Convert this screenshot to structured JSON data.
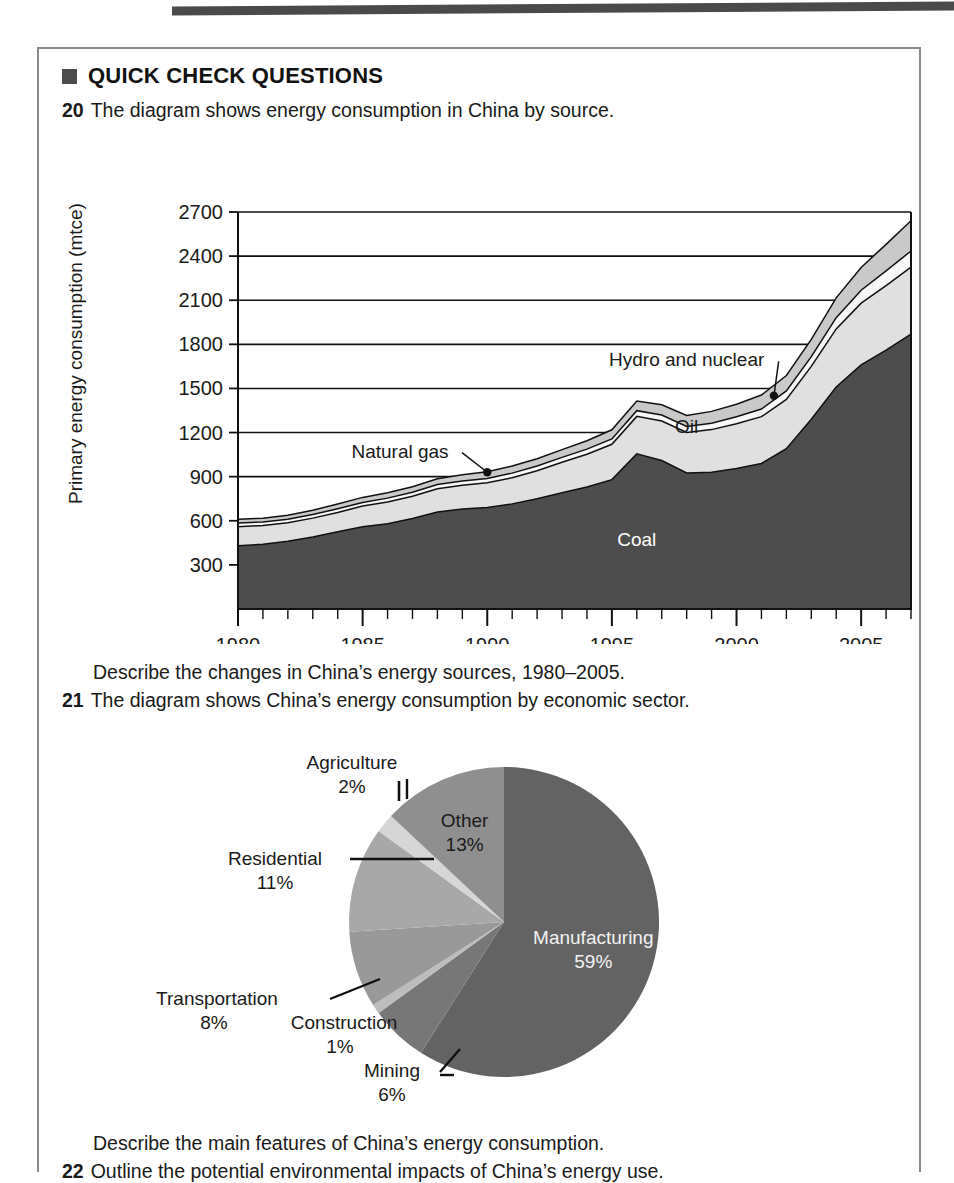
{
  "page": {
    "top_rule": "decorative-rule"
  },
  "heading": {
    "bullet": "filled-square-icon",
    "text": "QUICK CHECK QUESTIONS"
  },
  "questions": [
    {
      "number": "20",
      "text": "The diagram shows energy consumption in China by source."
    },
    {
      "number": "",
      "text": "Describe the changes in China’s energy sources, 1980–2005."
    },
    {
      "number": "21",
      "text": "The diagram shows China’s energy consumption by economic sector."
    },
    {
      "number": "",
      "text": "Describe the main features of China’s energy consumption."
    },
    {
      "number": "22",
      "text": "Outline the potential environmental impacts of China’s energy use."
    }
  ],
  "colors": {
    "coal": "#4d4d4d",
    "oil": "#e0e0e0",
    "natural_gas": "#f7f7f7",
    "hydro_nuclear": "#c9c9c9",
    "pie_manufacturing": "#636363",
    "pie_other": "#8f8f8f",
    "pie_agriculture": "#d6d6d6",
    "pie_residential": "#a8a8a8",
    "pie_transportation": "#999999",
    "pie_construction": "#bdbdbd",
    "pie_mining": "#777777",
    "outline": "#111111",
    "gridline": "#111111",
    "box_border": "#8a8a8a",
    "rule": "#4a4a4a"
  },
  "chart_data": [
    {
      "type": "area",
      "id": "energy-by-source",
      "title": "",
      "xlabel": "",
      "ylabel": "Primary energy consumption (mtce)",
      "ylim": [
        0,
        2700
      ],
      "xlim": [
        1980,
        2007
      ],
      "grid": true,
      "legend_position": "inline-labels",
      "ytick_labels": [
        "300",
        "600",
        "900",
        "1200",
        "1500",
        "1800",
        "2100",
        "2400",
        "2700"
      ],
      "yticks": [
        300,
        600,
        900,
        1200,
        1500,
        1800,
        2100,
        2400,
        2700
      ],
      "xtick_labels": [
        "1980",
        "1985",
        "1990",
        "1995",
        "2000",
        "2005"
      ],
      "xticks": [
        1980,
        1985,
        1990,
        1995,
        2000,
        2005
      ],
      "minor_xtick_interval": 1,
      "x": [
        1980,
        1981,
        1982,
        1983,
        1984,
        1985,
        1986,
        1987,
        1988,
        1989,
        1990,
        1991,
        1992,
        1993,
        1994,
        1995,
        1996,
        1997,
        1998,
        1999,
        2000,
        2001,
        2002,
        2003,
        2004,
        2005,
        2006,
        2007
      ],
      "series": [
        {
          "name": "Coal",
          "label_x": 1996,
          "label_y": 430,
          "label_color": "#ffffff",
          "values": [
            430,
            440,
            460,
            490,
            525,
            560,
            580,
            615,
            660,
            680,
            690,
            715,
            750,
            790,
            830,
            880,
            1055,
            1010,
            925,
            930,
            955,
            990,
            1090,
            1290,
            1510,
            1660,
            1760,
            1870
          ]
        },
        {
          "name": "Oil",
          "label_x": 1998,
          "label_y": 1200,
          "label_color": "#1a1a1a",
          "values": [
            130,
            128,
            126,
            128,
            132,
            140,
            148,
            152,
            158,
            162,
            168,
            178,
            190,
            208,
            222,
            240,
            255,
            268,
            275,
            290,
            305,
            318,
            335,
            360,
            395,
            420,
            440,
            455
          ]
        },
        {
          "name": "Natural gas",
          "label_x": 1986.5,
          "label_y": 1030,
          "label_color": "#1a1a1a",
          "leader_to_x": 1990,
          "leader_to_y": 930,
          "values": [
            25,
            24,
            24,
            24,
            25,
            25,
            26,
            27,
            28,
            29,
            30,
            31,
            32,
            33,
            35,
            37,
            39,
            41,
            42,
            44,
            47,
            52,
            58,
            66,
            76,
            88,
            100,
            110
          ]
        },
        {
          "name": "Hydro and nuclear",
          "label_x": 1998,
          "label_y": 1650,
          "label_color": "#1a1a1a",
          "leader_to_x": 2001.5,
          "leader_to_y": 1450,
          "values": [
            25,
            26,
            28,
            30,
            32,
            34,
            36,
            38,
            40,
            42,
            45,
            48,
            50,
            53,
            57,
            62,
            66,
            70,
            74,
            80,
            86,
            95,
            105,
            118,
            135,
            155,
            180,
            205
          ]
        }
      ]
    },
    {
      "type": "pie",
      "id": "energy-by-economic-sector",
      "title": "",
      "legend_position": "callout-labels",
      "start_angle_deg": 0,
      "direction": "clockwise",
      "labels": [
        "Manufacturing",
        "Mining",
        "Construction",
        "Transportation",
        "Residential",
        "Agriculture",
        "Other"
      ],
      "values": [
        59,
        6,
        1,
        8,
        11,
        2,
        13
      ],
      "value_text": [
        "59%",
        "6%",
        "1%",
        "8%",
        "11%",
        "2%",
        "13%"
      ],
      "slice_colors": [
        "#636363",
        "#777777",
        "#bdbdbd",
        "#999999",
        "#a8a8a8",
        "#d6d6d6",
        "#8f8f8f"
      ],
      "inside_label_indices": [
        0,
        6
      ]
    }
  ]
}
